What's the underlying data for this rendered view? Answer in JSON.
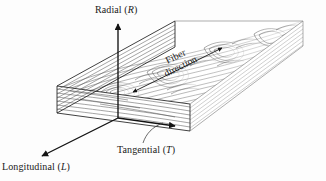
{
  "figure": {
    "background_color": "#fdfdfd",
    "ink_color": "#1a1a1a",
    "grain_color": "#555555"
  },
  "labels": {
    "radial": {
      "text": "Radial (",
      "symbol": "R",
      "close": ")"
    },
    "longitudinal": {
      "text": "Longitudinal (",
      "symbol": "L",
      "close": ")"
    },
    "tangential": {
      "text": "Tangential (",
      "symbol": "T",
      "close": ")"
    },
    "fiber": {
      "line1": "Fiber",
      "line2": "direction"
    }
  },
  "axes": [
    {
      "name": "radial",
      "label": "Radial (R)",
      "from": [
        118,
        118
      ],
      "to": [
        118,
        24
      ],
      "arrow": "single"
    },
    {
      "name": "tangential",
      "label": "Tangential (T)",
      "from": [
        118,
        118
      ],
      "to": [
        175,
        126
      ],
      "arrow": "single"
    },
    {
      "name": "longitudinal",
      "label": "Longitudinal (L)",
      "from": [
        118,
        118
      ],
      "to": [
        42,
        156
      ],
      "arrow": "single"
    }
  ],
  "annotations": [
    {
      "name": "fiber-direction",
      "label": "Fiber direction",
      "from": [
        133,
        92
      ],
      "to": [
        222,
        48
      ],
      "arrow": "double"
    },
    {
      "name": "tangential-leader",
      "from": [
        143,
        143
      ],
      "to": [
        163,
        124
      ],
      "arrow": "none"
    }
  ],
  "block": {
    "description": "Rectangular wood block in oblique projection with visible grain on top, front and left end faces"
  }
}
